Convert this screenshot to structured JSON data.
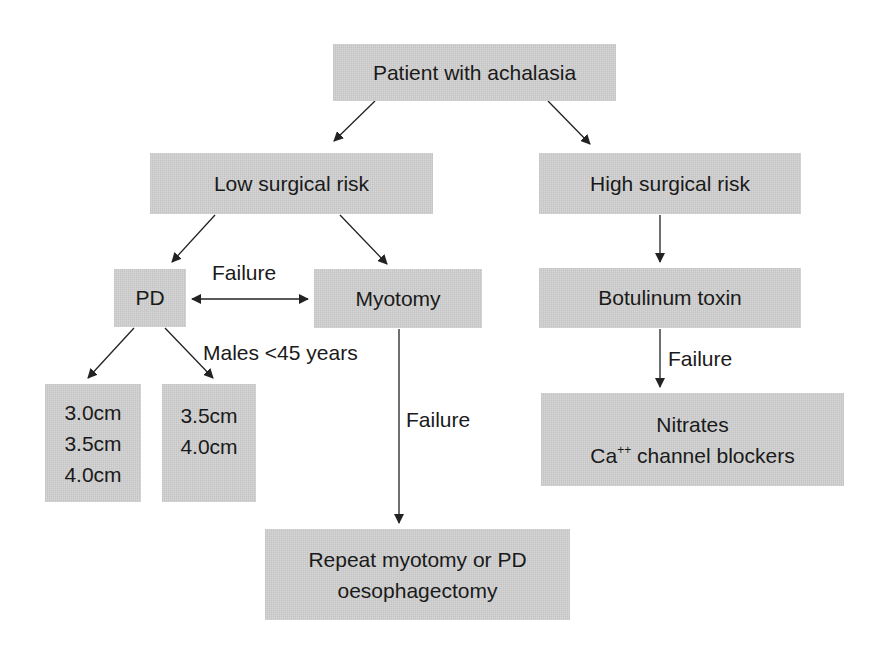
{
  "diagram": {
    "type": "flowchart",
    "nodes": {
      "root": {
        "label": "Patient with achalasia"
      },
      "low_risk": {
        "label": "Low surgical risk"
      },
      "high_risk": {
        "label": "High surgical risk"
      },
      "pd": {
        "label": "PD"
      },
      "myotomy": {
        "label": "Myotomy"
      },
      "botulinum": {
        "label": "Botulinum toxin"
      },
      "dilator_sizes_general": {
        "lines": [
          "3.0cm",
          "3.5cm",
          "4.0cm"
        ]
      },
      "dilator_sizes_males": {
        "lines": [
          "3.5cm",
          "4.0cm"
        ]
      },
      "nitrates": {
        "line1": "Nitrates",
        "line2_prefix": "Ca",
        "line2_sup": "++",
        "line2_suffix": " channel blockers"
      },
      "repeat": {
        "lines": [
          "Repeat myotomy or PD",
          "oesophagectomy"
        ]
      }
    },
    "edge_labels": {
      "pd_myotomy": "Failure",
      "males": "Males <45 years",
      "myotomy_failure": "Failure",
      "botulinum_failure": "Failure"
    },
    "edges": [
      {
        "from": "root",
        "to": "low_risk"
      },
      {
        "from": "root",
        "to": "high_risk"
      },
      {
        "from": "low_risk",
        "to": "pd"
      },
      {
        "from": "low_risk",
        "to": "myotomy"
      },
      {
        "from": "pd",
        "to": "myotomy",
        "bidirectional": true,
        "label": "Failure"
      },
      {
        "from": "pd",
        "to": "dilator_sizes_general"
      },
      {
        "from": "pd",
        "to": "dilator_sizes_males",
        "label": "Males <45 years"
      },
      {
        "from": "myotomy",
        "to": "repeat",
        "label": "Failure"
      },
      {
        "from": "high_risk",
        "to": "botulinum"
      },
      {
        "from": "botulinum",
        "to": "nitrates",
        "label": "Failure"
      }
    ],
    "colors": {
      "box_fill": "#cfcfcf",
      "text": "#1a1a1a",
      "arrow": "#222222",
      "background": "#ffffff"
    }
  }
}
